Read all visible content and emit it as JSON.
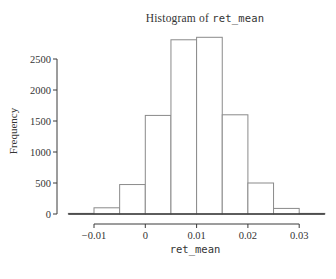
{
  "figure": {
    "title_prefix": "Histogram of ",
    "title_var": "ret_mean",
    "xlabel": "ret_mean",
    "ylabel": "Frequency"
  },
  "chart_data": {
    "type": "bar",
    "subtype": "histogram",
    "title": "Histogram of ret_mean",
    "xlabel": "ret_mean",
    "ylabel": "Frequency",
    "bin_start": -0.015,
    "bin_width": 0.005,
    "bin_edges": [
      -0.015,
      -0.01,
      -0.005,
      0,
      0.005,
      0.01,
      0.015,
      0.02,
      0.025,
      0.03,
      0.035
    ],
    "counts": [
      10,
      100,
      475,
      1590,
      2810,
      2850,
      1600,
      500,
      90,
      10
    ],
    "x_ticks": [
      -0.01,
      0,
      0.01,
      0.02,
      0.03
    ],
    "x_tick_labels": [
      "−0.01",
      "0",
      "0.01",
      "0.02",
      "0.03"
    ],
    "y_ticks": [
      0,
      500,
      1000,
      1500,
      2000,
      2500
    ],
    "y_tick_labels": [
      "0",
      "500",
      "1000",
      "1500",
      "2000",
      "2500"
    ],
    "xlim": [
      -0.017,
      0.037
    ],
    "ylim": [
      0,
      2900
    ],
    "grid": false,
    "legend": "none",
    "bar_fill": "#ffffff",
    "bar_stroke": "#8a8a8a",
    "axis_color": "#3a3a3a",
    "text_color": "#343434",
    "background": "#ffffff"
  }
}
